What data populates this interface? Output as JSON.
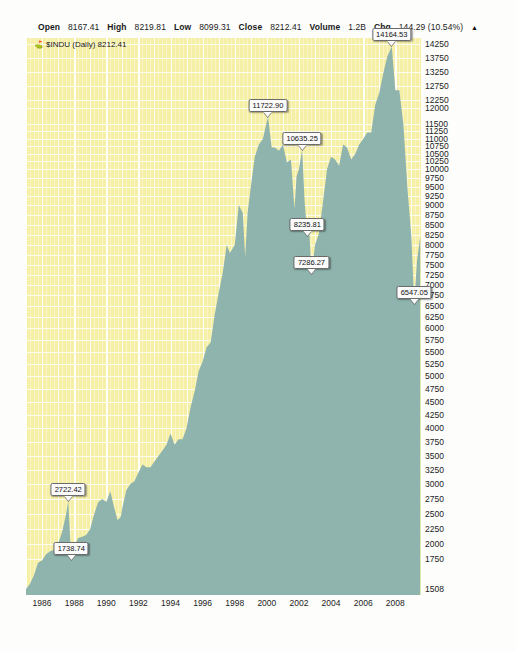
{
  "quote": {
    "open_label": "Open",
    "open_value": "8167.41",
    "high_label": "High",
    "high_value": "8219.81",
    "low_label": "Low",
    "low_value": "8099.31",
    "close_label": "Close",
    "close_value": "8212.41",
    "volume_label": "Volume",
    "volume_value": "1.2B",
    "chg_label": "Chg",
    "chg_value": "144.29 (10.54%)",
    "direction_icon": "up-triangle-icon",
    "direction_glyph": "▲"
  },
  "chart_label": {
    "flag_glyph": "⛳",
    "text": "$INDU (Daily) 8212.41"
  },
  "colors": {
    "plot_background": "#f6efa6",
    "area_fill": "#8fb3ad",
    "gridline": "#ffffff",
    "text": "#1a1a1a",
    "callout_bg": "#fbfbfb",
    "callout_border": "#6b6b6b"
  },
  "chart_data": {
    "type": "area",
    "title": "$INDU (Daily) 8212.41",
    "xlabel": "",
    "ylabel": "",
    "grid": true,
    "legend": "none",
    "ylim": [
      1508,
      14500
    ],
    "xlim": [
      1985.0,
      2009.6
    ],
    "ytick_labels": [
      "14250",
      "13750",
      "13250",
      "12750",
      "12250",
      "12000",
      "11500",
      "11250",
      "11000",
      "10750",
      "10500",
      "10250",
      "10000",
      "9750",
      "9500",
      "9250",
      "9000",
      "8750",
      "8500",
      "8250",
      "8000",
      "7750",
      "7500",
      "7250",
      "7000",
      "6750",
      "6500",
      "6250",
      "6000",
      "5750",
      "5500",
      "5250",
      "5000",
      "4750",
      "4500",
      "4250",
      "4000",
      "3750",
      "3500",
      "3250",
      "3000",
      "2750",
      "2500",
      "2250",
      "2000",
      "1750",
      "1508"
    ],
    "ytick_values": [
      14250,
      13750,
      13250,
      12750,
      12250,
      12000,
      11500,
      11250,
      11000,
      10750,
      10500,
      10250,
      10000,
      9750,
      9500,
      9250,
      9000,
      8750,
      8500,
      8250,
      8000,
      7750,
      7500,
      7250,
      7000,
      6750,
      6500,
      6250,
      6000,
      5750,
      5500,
      5250,
      5000,
      4750,
      4500,
      4250,
      4000,
      3750,
      3500,
      3250,
      3000,
      2750,
      2500,
      2250,
      2000,
      1750,
      1508
    ],
    "xtick_labels": [
      "1986",
      "1988",
      "1990",
      "1992",
      "1994",
      "1996",
      "1998",
      "2000",
      "2002",
      "2004",
      "2006",
      "2008"
    ],
    "xtick_values": [
      1986,
      1988,
      1990,
      1992,
      1994,
      1996,
      1998,
      2000,
      2002,
      2004,
      2006,
      2008
    ],
    "annotations": [
      {
        "label": "14164.53",
        "value": 14164.53,
        "x": 2007.78,
        "placement": "above"
      },
      {
        "label": "11722.90",
        "value": 11722.9,
        "x": 2000.07,
        "placement": "above"
      },
      {
        "label": "10635.25",
        "value": 10635.25,
        "x": 2002.2,
        "placement": "above"
      },
      {
        "label": "8235.81",
        "value": 8235.81,
        "x": 2002.52,
        "placement": "above"
      },
      {
        "label": "7286.27",
        "value": 7286.27,
        "x": 2002.78,
        "placement": "above"
      },
      {
        "label": "6547.05",
        "value": 6547.05,
        "x": 2009.18,
        "placement": "above"
      },
      {
        "label": "2722.42",
        "value": 2722.42,
        "x": 1987.63,
        "placement": "above"
      },
      {
        "label": "1738.74",
        "value": 1738.74,
        "x": 1987.82,
        "placement": "above"
      }
    ],
    "series": [
      {
        "name": "$INDU",
        "x": [
          1985.0,
          1985.25,
          1985.5,
          1985.75,
          1986.0,
          1986.25,
          1986.5,
          1986.75,
          1987.0,
          1987.25,
          1987.5,
          1987.63,
          1987.82,
          1988.0,
          1988.25,
          1988.5,
          1988.75,
          1989.0,
          1989.25,
          1989.5,
          1989.75,
          1990.0,
          1990.25,
          1990.5,
          1990.7,
          1990.9,
          1991.0,
          1991.25,
          1991.5,
          1991.75,
          1992.0,
          1992.25,
          1992.5,
          1992.75,
          1993.0,
          1993.25,
          1993.5,
          1993.75,
          1994.0,
          1994.25,
          1994.5,
          1994.75,
          1995.0,
          1995.25,
          1995.5,
          1995.75,
          1996.0,
          1996.25,
          1996.5,
          1996.75,
          1997.0,
          1997.25,
          1997.5,
          1997.7,
          1997.85,
          1998.0,
          1998.25,
          1998.5,
          1998.65,
          1998.8,
          1999.0,
          1999.25,
          1999.5,
          1999.75,
          2000.07,
          2000.3,
          2000.5,
          2000.75,
          2001.0,
          2001.25,
          2001.5,
          2001.72,
          2001.85,
          2002.0,
          2002.2,
          2002.35,
          2002.52,
          2002.65,
          2002.78,
          2003.0,
          2003.25,
          2003.5,
          2003.75,
          2004.0,
          2004.25,
          2004.5,
          2004.75,
          2005.0,
          2005.25,
          2005.5,
          2005.75,
          2006.0,
          2006.25,
          2006.5,
          2006.75,
          2007.0,
          2007.25,
          2007.5,
          2007.78,
          2008.0,
          2008.25,
          2008.5,
          2008.75,
          2009.0,
          2009.18,
          2009.35,
          2009.55
        ],
        "values": [
          1508,
          1550,
          1620,
          1720,
          1738.74,
          1830,
          1880,
          1900,
          2000,
          2200,
          2500,
          2722.42,
          1738.74,
          1960,
          2100,
          2120,
          2150,
          2250,
          2500,
          2700,
          2750,
          2700,
          2880,
          2600,
          2400,
          2450,
          2600,
          2900,
          3000,
          3050,
          3200,
          3350,
          3300,
          3300,
          3400,
          3500,
          3600,
          3700,
          3900,
          3700,
          3800,
          3800,
          4000,
          4400,
          4700,
          5100,
          5300,
          5600,
          5700,
          6300,
          6800,
          7300,
          8000,
          7800,
          7900,
          8000,
          9000,
          8800,
          7700,
          8800,
          9500,
          10400,
          10800,
          11000,
          11722.9,
          10700,
          10700,
          10600,
          10800,
          10200,
          10300,
          8900,
          9800,
          10000,
          10635.25,
          9100,
          8235.81,
          8300,
          7286.27,
          8000,
          8300,
          9100,
          10000,
          10400,
          10300,
          10100,
          10800,
          10700,
          10300,
          10500,
          10800,
          11000,
          11200,
          11200,
          12100,
          12500,
          13200,
          13800,
          14164.53,
          12600,
          12600,
          11500,
          9500,
          8200,
          6547.05,
          7600,
          8212.41
        ]
      }
    ]
  }
}
